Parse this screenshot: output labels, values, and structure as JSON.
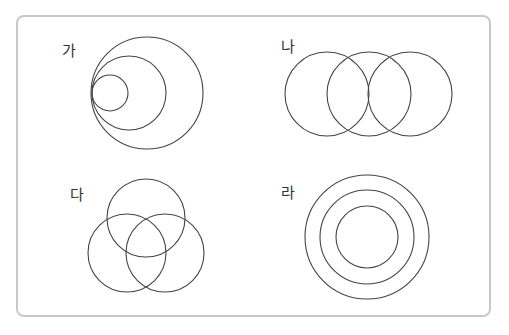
{
  "panels": [
    {
      "label": "가",
      "relation": "nested circles sharing one tangent point on the left",
      "circle_count": 3
    },
    {
      "label": "나",
      "relation": "three circles in a horizontal chain, each overlapping its neighbor",
      "circle_count": 3
    },
    {
      "label": "다",
      "relation": "three mutually overlapping circles (Venn diagram)",
      "circle_count": 3
    },
    {
      "label": "라",
      "relation": "three concentric circles",
      "circle_count": 3
    }
  ],
  "colors": {
    "stroke": "#444444",
    "frame": "#c8c8c8",
    "text": "#333333"
  }
}
